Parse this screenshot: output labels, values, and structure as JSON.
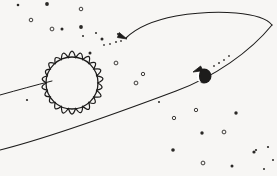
{
  "scene": {
    "title": "Planet orbiting a sun",
    "kind": "hand-drawn astronomy sketch",
    "width": 277,
    "height": 176,
    "background_color": "#f7f6f4",
    "ink_color": "#1d1c1b"
  },
  "sun": {
    "label": "sun",
    "center_x": 72,
    "center_y": 83,
    "core_radius": 26,
    "ray_outer_radius": 37,
    "ray_count": 22,
    "fill_color": "#ffffff",
    "stroke_color": "#1d1c1b"
  },
  "planet": {
    "label": "planet",
    "center_x": 204,
    "center_y": 76,
    "radius": 7.5,
    "fill_color": "#171615",
    "highlight": "crescent-left",
    "highlight_color": "#ffffff"
  },
  "orbit": {
    "label": "orbital path",
    "style": "perspective ellipse, open at left edge",
    "stroke_color": "#1d1c1b",
    "stroke_width": 1.1,
    "upper_arc_path": "M 272 25 C 262 12 218 9 176 16 C 150 21 134 30 126 38",
    "lower_arc_path": "M 0 150 C 48 138 120 112 176 91 C 214 77 250 52 272 25",
    "near_left_path": "M 0 95 C 18 90 36 85 52 81",
    "dash_upper_path": "M 126 39 C 120 41 112 43 103 45",
    "dash_lower_path": "M 240 46 C 230 53 220 60 212 67"
  },
  "arrows": [
    {
      "name": "orbit-arrow-left",
      "direction": "left",
      "tip_x": 127,
      "tip_y": 39,
      "angle_deg": 200
    },
    {
      "name": "orbit-arrow-right",
      "direction": "up-right",
      "tip_x": 193,
      "tip_y": 72,
      "angle_deg": 333
    }
  ],
  "stars": [
    {
      "x": 18,
      "y": 5,
      "r": 1.3,
      "type": "dot"
    },
    {
      "x": 47,
      "y": 4,
      "r": 1.9,
      "type": "dot"
    },
    {
      "x": 81,
      "y": 9,
      "r": 1.8,
      "type": "ring"
    },
    {
      "x": 31,
      "y": 20,
      "r": 1.8,
      "type": "ring"
    },
    {
      "x": 52,
      "y": 29,
      "r": 1.9,
      "type": "ring"
    },
    {
      "x": 62,
      "y": 29,
      "r": 1.5,
      "type": "dot"
    },
    {
      "x": 81,
      "y": 27,
      "r": 1.9,
      "type": "dot"
    },
    {
      "x": 83,
      "y": 36,
      "r": 1.0,
      "type": "dot"
    },
    {
      "x": 96,
      "y": 33,
      "r": 1.0,
      "type": "dot"
    },
    {
      "x": 102,
      "y": 39,
      "r": 1.5,
      "type": "dot"
    },
    {
      "x": 118,
      "y": 34,
      "r": 1.1,
      "type": "dot"
    },
    {
      "x": 90,
      "y": 53,
      "r": 1.5,
      "type": "dot"
    },
    {
      "x": 116,
      "y": 63,
      "r": 1.9,
      "type": "ring"
    },
    {
      "x": 143,
      "y": 74,
      "r": 1.7,
      "type": "ring"
    },
    {
      "x": 136,
      "y": 83,
      "r": 1.9,
      "type": "ring"
    },
    {
      "x": 27,
      "y": 100,
      "r": 1.1,
      "type": "dot"
    },
    {
      "x": 196,
      "y": 110,
      "r": 1.7,
      "type": "ring"
    },
    {
      "x": 174,
      "y": 118,
      "r": 1.7,
      "type": "ring"
    },
    {
      "x": 236,
      "y": 113,
      "r": 1.7,
      "type": "dot"
    },
    {
      "x": 202,
      "y": 133,
      "r": 1.7,
      "type": "dot"
    },
    {
      "x": 224,
      "y": 132,
      "r": 1.9,
      "type": "ring"
    },
    {
      "x": 173,
      "y": 150,
      "r": 1.8,
      "type": "dot"
    },
    {
      "x": 203,
      "y": 163,
      "r": 1.9,
      "type": "ring"
    },
    {
      "x": 254,
      "y": 152,
      "r": 1.6,
      "type": "dot"
    },
    {
      "x": 256,
      "y": 150,
      "r": 1.1,
      "type": "dot"
    },
    {
      "x": 268,
      "y": 147,
      "r": 1.1,
      "type": "dot"
    },
    {
      "x": 232,
      "y": 166,
      "r": 1.5,
      "type": "dot"
    },
    {
      "x": 264,
      "y": 169,
      "r": 1.0,
      "type": "dot"
    },
    {
      "x": 273,
      "y": 160,
      "r": 1.0,
      "type": "dot"
    },
    {
      "x": 159,
      "y": 102,
      "r": 1.0,
      "type": "dot"
    }
  ],
  "trail_dots_upper": [
    {
      "x": 104,
      "y": 45,
      "r": 0.9
    },
    {
      "x": 110,
      "y": 44,
      "r": 0.9
    },
    {
      "x": 116,
      "y": 42,
      "r": 1.0
    },
    {
      "x": 121,
      "y": 41,
      "r": 0.9
    }
  ],
  "trail_dots_lower": [
    {
      "x": 214,
      "y": 66,
      "r": 0.9
    },
    {
      "x": 219,
      "y": 63,
      "r": 1.0
    },
    {
      "x": 224,
      "y": 60,
      "r": 0.9
    },
    {
      "x": 229,
      "y": 56,
      "r": 0.9
    }
  ]
}
